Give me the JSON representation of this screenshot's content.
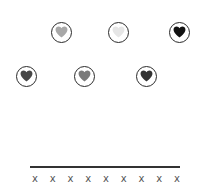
{
  "tokens": [
    {
      "id": "heart-1",
      "row": 1,
      "cx": 61,
      "cy": 32,
      "fill": "#a8a8a8",
      "icon": "heart-icon"
    },
    {
      "id": "heart-2",
      "row": 1,
      "cx": 118,
      "cy": 32,
      "fill": "#e6e6e6",
      "icon": "heart-icon"
    },
    {
      "id": "heart-3",
      "row": 1,
      "cx": 179,
      "cy": 32,
      "fill": "#111111",
      "icon": "heart-icon"
    },
    {
      "id": "heart-4",
      "row": 2,
      "cx": 26,
      "cy": 76,
      "fill": "#474747",
      "icon": "heart-icon"
    },
    {
      "id": "heart-5",
      "row": 2,
      "cx": 84,
      "cy": 76,
      "fill": "#7a7a7a",
      "icon": "heart-icon"
    },
    {
      "id": "heart-6",
      "row": 2,
      "cx": 146,
      "cy": 76,
      "fill": "#333333",
      "icon": "heart-icon"
    }
  ],
  "slots": {
    "count": 9,
    "marks": [
      "x",
      "x",
      "x",
      "x",
      "x",
      "x",
      "x",
      "x",
      "x"
    ]
  },
  "colors": {
    "ring": "#2a2a2a",
    "baseline": "#333333",
    "mark": "#555555",
    "background": "#ffffff"
  }
}
